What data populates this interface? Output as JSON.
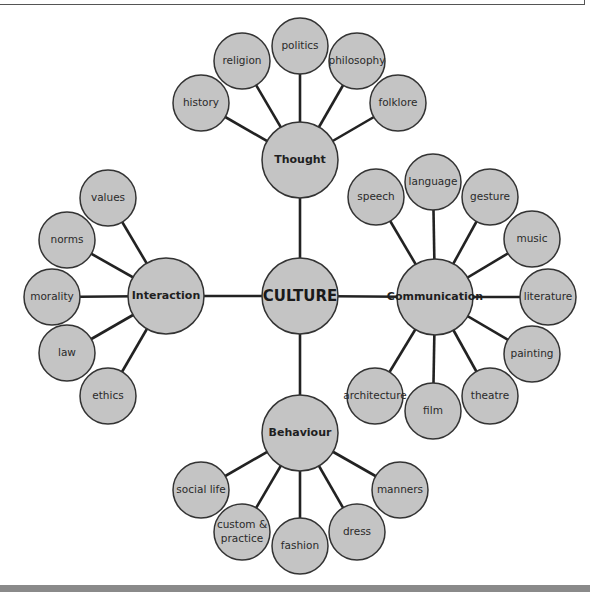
{
  "diagram": {
    "root": {
      "label": "CULTURE",
      "x": 300,
      "y": 296,
      "r": 38
    },
    "hubs": [
      {
        "id": "thought",
        "label": "Thought",
        "x": 300,
        "y": 160,
        "r": 38,
        "leaves": [
          {
            "label": "history",
            "x": 201,
            "y": 103
          },
          {
            "label": "religion",
            "x": 242,
            "y": 61
          },
          {
            "label": "politics",
            "x": 300,
            "y": 46
          },
          {
            "label": "philosophy",
            "x": 357,
            "y": 61
          },
          {
            "label": "folklore",
            "x": 398,
            "y": 103
          }
        ]
      },
      {
        "id": "interaction",
        "label": "Interaction",
        "x": 166,
        "y": 296,
        "r": 38,
        "leaves": [
          {
            "label": "values",
            "x": 108,
            "y": 198
          },
          {
            "label": "norms",
            "x": 67,
            "y": 240
          },
          {
            "label": "morality",
            "x": 52,
            "y": 297
          },
          {
            "label": "law",
            "x": 67,
            "y": 353
          },
          {
            "label": "ethics",
            "x": 108,
            "y": 396
          }
        ]
      },
      {
        "id": "communication",
        "label": "Communication",
        "x": 435,
        "y": 297,
        "r": 38,
        "leaves": [
          {
            "label": "speech",
            "x": 376,
            "y": 197
          },
          {
            "label": "language",
            "x": 433,
            "y": 182
          },
          {
            "label": "gesture",
            "x": 490,
            "y": 197
          },
          {
            "label": "music",
            "x": 532,
            "y": 239
          },
          {
            "label": "literature",
            "x": 548,
            "y": 297
          },
          {
            "label": "painting",
            "x": 532,
            "y": 354
          },
          {
            "label": "theatre",
            "x": 490,
            "y": 396
          },
          {
            "label": "film",
            "x": 433,
            "y": 411
          },
          {
            "label": "architecture",
            "x": 375,
            "y": 396
          }
        ]
      },
      {
        "id": "behaviour",
        "label": "Behaviour",
        "x": 300,
        "y": 433,
        "r": 38,
        "leaves": [
          {
            "label": "social life",
            "x": 201,
            "y": 490
          },
          {
            "label": "custom &",
            "label2": "practice",
            "x": 242,
            "y": 532
          },
          {
            "label": "fashion",
            "x": 300,
            "y": 546
          },
          {
            "label": "dress",
            "x": 357,
            "y": 532
          },
          {
            "label": "manners",
            "x": 400,
            "y": 490
          }
        ]
      }
    ],
    "leaf_radius": 28,
    "colors": {
      "node_fill": "#c4c4c4",
      "node_stroke": "#333333",
      "edge": "#222222"
    }
  }
}
